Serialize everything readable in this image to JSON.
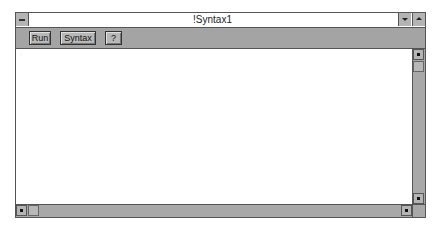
{
  "window": {
    "title": "!Syntax1",
    "sysmenu_icon": "system-menu-icon",
    "minimize_icon": "triangle-down-icon",
    "maximize_icon": "triangle-up-icon"
  },
  "toolbar": {
    "run_label": "Run",
    "syntax_label": "Syntax",
    "help_label": "?"
  },
  "editor": {
    "content": "",
    "marker": "·"
  },
  "scrollbars": {
    "vertical": {
      "up_icon": "arrow-up-icon",
      "down_icon": "arrow-down-icon"
    },
    "horizontal": {
      "left_icon": "arrow-left-icon",
      "right_icon": "arrow-right-icon"
    }
  },
  "colors": {
    "chrome": "#a8a8a8",
    "editor_bg": "#ffffff",
    "border": "#555555"
  }
}
